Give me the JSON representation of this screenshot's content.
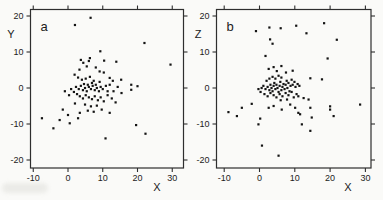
{
  "figure": {
    "background": "#fafaf8",
    "point_color": "#141414",
    "frame_color": "#2e2e2e",
    "text_color": "#1c1c1c"
  },
  "chart_data": [
    {
      "type": "scatter",
      "panel_label": "a",
      "xlabel": "X",
      "ylabel": "Y",
      "xlim": [
        -12,
        32
      ],
      "ylim": [
        -22,
        22
      ],
      "x_ticks": [
        "-10",
        "0",
        "10",
        "20",
        "30"
      ],
      "y_ticks": [
        "20",
        "10",
        "0",
        "-10",
        "-20"
      ],
      "grid": false,
      "legend": null,
      "points": [
        [
          2,
          17.5
        ],
        [
          6.5,
          19.5
        ],
        [
          9.3,
          10.2
        ],
        [
          22,
          12.5
        ],
        [
          29.5,
          6.5
        ],
        [
          13.9,
          7.3
        ],
        [
          10.4,
          7.6
        ],
        [
          3.7,
          7.8
        ],
        [
          4.4,
          7
        ],
        [
          6,
          7.5
        ],
        [
          6.3,
          8.3
        ],
        [
          5.4,
          6
        ],
        [
          3.3,
          5.1
        ],
        [
          1.9,
          3.7
        ],
        [
          9.1,
          4.6
        ],
        [
          8,
          5.7
        ],
        [
          10.3,
          4.3
        ],
        [
          12,
          2.8
        ],
        [
          15.3,
          2.3
        ],
        [
          12.9,
          2
        ],
        [
          18.2,
          0.9
        ],
        [
          18.2,
          -0.5
        ],
        [
          20,
          0.5
        ],
        [
          14.3,
          0.3
        ],
        [
          15.4,
          -1.4
        ],
        [
          13.1,
          -0.9
        ],
        [
          2.9,
          2.9
        ],
        [
          4,
          2.3
        ],
        [
          5.1,
          2.6
        ],
        [
          6.3,
          3.1
        ],
        [
          7.4,
          2
        ],
        [
          4.6,
          1.1
        ],
        [
          5.7,
          0.9
        ],
        [
          6.9,
          1.4
        ],
        [
          8,
          0.9
        ],
        [
          9.1,
          1.7
        ],
        [
          2.3,
          0.3
        ],
        [
          3.1,
          -0.3
        ],
        [
          3.7,
          0.6
        ],
        [
          4.3,
          -0.6
        ],
        [
          4.9,
          0
        ],
        [
          5.4,
          -0.9
        ],
        [
          6,
          0.3
        ],
        [
          6.6,
          -0.3
        ],
        [
          7.1,
          0.6
        ],
        [
          7.7,
          -0.6
        ],
        [
          8.3,
          0
        ],
        [
          8.9,
          -0.9
        ],
        [
          9.4,
          0.3
        ],
        [
          10,
          -0.3
        ],
        [
          10.9,
          0.6
        ],
        [
          11.4,
          -0.9
        ],
        [
          0.9,
          -0.3
        ],
        [
          1.7,
          -1.1
        ],
        [
          12,
          0.9
        ],
        [
          2.6,
          -1.7
        ],
        [
          3.4,
          -2.3
        ],
        [
          4.3,
          -2.9
        ],
        [
          5.1,
          -2
        ],
        [
          6,
          -2.6
        ],
        [
          6.9,
          -3.1
        ],
        [
          7.7,
          -2.3
        ],
        [
          8.6,
          -3.4
        ],
        [
          9.4,
          -2.6
        ],
        [
          10.3,
          -3.7
        ],
        [
          11.4,
          -2
        ],
        [
          12.6,
          -2.9
        ],
        [
          13.7,
          -4
        ],
        [
          4.9,
          -4.6
        ],
        [
          6.6,
          -5.1
        ],
        [
          8.3,
          -4.9
        ],
        [
          2,
          -4.3
        ],
        [
          0.3,
          -2
        ],
        [
          -0.9,
          -0.9
        ],
        [
          5.7,
          -6.3
        ],
        [
          7.4,
          -6.6
        ],
        [
          9.7,
          -6
        ],
        [
          12,
          -6.9
        ],
        [
          3.4,
          -6.9
        ],
        [
          -1.5,
          -6
        ],
        [
          0,
          -7.5
        ],
        [
          -2.4,
          -8.9
        ],
        [
          2.9,
          -8.4
        ],
        [
          0.5,
          -9.8
        ],
        [
          -7.5,
          -8.4
        ],
        [
          -4.2,
          -11.2
        ],
        [
          10.8,
          -14
        ],
        [
          19.6,
          -10.3
        ],
        [
          22.3,
          -12.7
        ]
      ]
    },
    {
      "type": "scatter",
      "panel_label": "b",
      "xlabel": "X",
      "ylabel": "Z",
      "xlim": [
        -12,
        32
      ],
      "ylim": [
        -22,
        22
      ],
      "x_ticks": [
        "-10",
        "0",
        "10",
        "20",
        "30"
      ],
      "y_ticks": [
        "20",
        "10",
        "0",
        "-10",
        "-20"
      ],
      "grid": false,
      "legend": null,
      "points": [
        [
          -1,
          15.8
        ],
        [
          2.8,
          16.8
        ],
        [
          6,
          16.6
        ],
        [
          10.4,
          17.3
        ],
        [
          18.3,
          18
        ],
        [
          13.3,
          15.2
        ],
        [
          21.9,
          13.4
        ],
        [
          3,
          13.5
        ],
        [
          3.7,
          12.3
        ],
        [
          1.7,
          8.9
        ],
        [
          19.3,
          8.2
        ],
        [
          2.6,
          5.3
        ],
        [
          4,
          5.8
        ],
        [
          4.9,
          4.7
        ],
        [
          9.4,
          4.8
        ],
        [
          7.5,
          4.3
        ],
        [
          6.2,
          6.1
        ],
        [
          17.7,
          2.4
        ],
        [
          14.4,
          2.7
        ],
        [
          0.6,
          0
        ],
        [
          1.1,
          0.6
        ],
        [
          1.7,
          -0.3
        ],
        [
          2.3,
          0.3
        ],
        [
          2.8,
          -0.6
        ],
        [
          3.1,
          0.9
        ],
        [
          3.4,
          0
        ],
        [
          3.7,
          -0.9
        ],
        [
          4,
          0.6
        ],
        [
          4.2,
          1.4
        ],
        [
          4.5,
          -0.3
        ],
        [
          4.8,
          0.9
        ],
        [
          5.1,
          0
        ],
        [
          5.4,
          -1.1
        ],
        [
          5.7,
          0.6
        ],
        [
          5.9,
          1.7
        ],
        [
          6.2,
          -0.6
        ],
        [
          6.5,
          0.3
        ],
        [
          6.8,
          1.1
        ],
        [
          7.1,
          -0.3
        ],
        [
          7.4,
          0.9
        ],
        [
          7.7,
          2
        ],
        [
          7.9,
          0
        ],
        [
          8.2,
          1.4
        ],
        [
          8.5,
          -0.9
        ],
        [
          8.8,
          0.6
        ],
        [
          9.1,
          2.3
        ],
        [
          9.4,
          0.9
        ],
        [
          9.9,
          1.7
        ],
        [
          10.2,
          0.3
        ],
        [
          10.8,
          1.1
        ],
        [
          11.3,
          0.6
        ],
        [
          2,
          2
        ],
        [
          2.8,
          2.6
        ],
        [
          3.7,
          3.1
        ],
        [
          4.5,
          2.6
        ],
        [
          5.4,
          3.4
        ],
        [
          6.2,
          2.9
        ],
        [
          0.3,
          -1.1
        ],
        [
          -0.3,
          -0.3
        ],
        [
          1.4,
          -1.7
        ],
        [
          2.3,
          -2.3
        ],
        [
          3.1,
          -1.4
        ],
        [
          4,
          -2
        ],
        [
          4.8,
          -2.6
        ],
        [
          5.7,
          -1.7
        ],
        [
          6.5,
          -2.3
        ],
        [
          7.4,
          -1.4
        ],
        [
          8.2,
          -2
        ],
        [
          9.1,
          -1.1
        ],
        [
          9.7,
          -2.6
        ],
        [
          10.5,
          -1.7
        ],
        [
          6,
          -3.4
        ],
        [
          7.8,
          -3.2
        ],
        [
          8.7,
          -4.6
        ],
        [
          6.3,
          -6
        ],
        [
          4,
          -5
        ],
        [
          2.6,
          -5.5
        ],
        [
          11,
          -6.9
        ],
        [
          11,
          -2.3
        ],
        [
          12.5,
          -2.8
        ],
        [
          13.9,
          -3.2
        ],
        [
          14.4,
          -5.5
        ],
        [
          20,
          -5.1
        ],
        [
          20,
          -6
        ],
        [
          21,
          -7.8
        ],
        [
          28.5,
          -4.6
        ],
        [
          14.8,
          -8.2
        ],
        [
          12,
          -10.1
        ],
        [
          14.4,
          -11.9
        ],
        [
          10.1,
          -5.5
        ],
        [
          11.5,
          -7.3
        ],
        [
          -5,
          -5.5
        ],
        [
          -2.2,
          -4.4
        ],
        [
          -8.8,
          -6.7
        ],
        [
          -6.4,
          -7.8
        ],
        [
          0.2,
          -8.5
        ],
        [
          -0.3,
          -10.1
        ],
        [
          0.7,
          -16
        ],
        [
          5.4,
          -18.8
        ]
      ]
    }
  ]
}
